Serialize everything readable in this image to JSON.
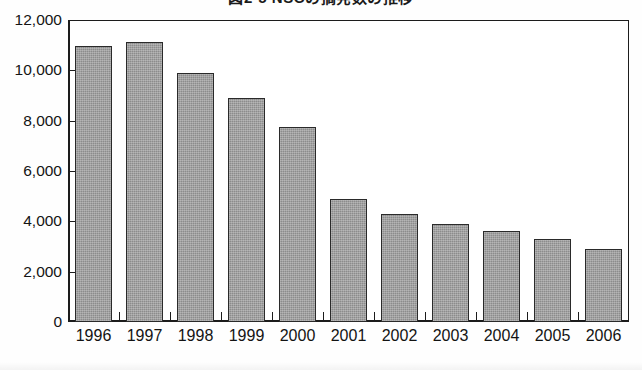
{
  "chart_title_clipped": "図2-5 NSCの摘発数の推移",
  "chart_data": {
    "type": "bar",
    "title": "図2-5 NSCの摘発数の推移",
    "xlabel": "",
    "ylabel": "",
    "categories": [
      "1996",
      "1997",
      "1998",
      "1999",
      "2000",
      "2001",
      "2002",
      "2003",
      "2004",
      "2005",
      "2006"
    ],
    "values": [
      10950,
      11120,
      9900,
      8900,
      7750,
      4900,
      4280,
      3900,
      3620,
      3280,
      2900
    ],
    "ylim": [
      0,
      12000
    ],
    "ytick_values": [
      0,
      2000,
      4000,
      6000,
      8000,
      10000,
      12000
    ],
    "ytick_labels": [
      "0",
      "2,000",
      "4,000",
      "6,000",
      "8,000",
      "10,000",
      "12,000"
    ],
    "grid": false,
    "legend": false,
    "legend_position": "none",
    "bar_fill_color": "#8c8c8c",
    "bar_edge_color": "#2a2a2a",
    "axis_color": "#1c1c1c",
    "background_color": "#ffffff"
  }
}
